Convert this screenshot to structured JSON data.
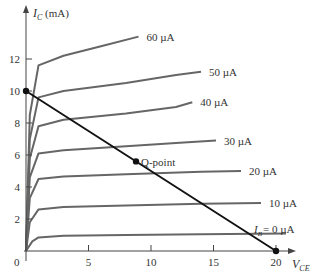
{
  "chart_data": {
    "type": "line",
    "title": "",
    "xlabel": "V_CE",
    "ylabel": "I_C (mA)",
    "xlim": [
      0,
      20
    ],
    "ylim": [
      0,
      14
    ],
    "x_ticks": [
      0,
      5,
      10,
      15,
      20
    ],
    "y_ticks": [
      2,
      4,
      6,
      8,
      10,
      12
    ],
    "series": [
      {
        "name": "I_B = 0 µA",
        "label": "= 0 µA",
        "x": [
          0,
          0.5,
          1,
          3,
          8,
          14,
          20.8
        ],
        "values": [
          0,
          0.6,
          0.85,
          0.95,
          1.0,
          1.05,
          1.1
        ]
      },
      {
        "name": "10 µA",
        "label": "10 µA",
        "x": [
          0,
          0.3,
          1,
          3,
          8,
          14,
          18.8
        ],
        "values": [
          0,
          1.8,
          2.6,
          2.75,
          2.85,
          2.95,
          3.0
        ]
      },
      {
        "name": "20 µA",
        "label": "20 µA",
        "x": [
          0,
          0.3,
          1,
          3,
          8,
          14,
          17.2
        ],
        "values": [
          0,
          3.3,
          4.5,
          4.65,
          4.8,
          4.95,
          5.0
        ]
      },
      {
        "name": "30 µA",
        "label": "30 µA",
        "x": [
          0,
          0.3,
          1,
          3,
          8,
          12,
          15.2
        ],
        "values": [
          0,
          4.6,
          6.1,
          6.3,
          6.55,
          6.75,
          6.9
        ]
      },
      {
        "name": "40 µA",
        "label": "40 µA",
        "x": [
          0,
          0.3,
          1,
          3,
          8,
          12,
          13.3
        ],
        "values": [
          0,
          5.8,
          7.8,
          8.2,
          8.6,
          9.0,
          9.3
        ]
      },
      {
        "name": "50 µA",
        "label": "50 µA",
        "x": [
          0,
          0.3,
          1,
          3,
          8,
          12,
          14.0
        ],
        "values": [
          0,
          7.0,
          9.6,
          10.0,
          10.5,
          11.0,
          11.2
        ]
      },
      {
        "name": "60 µA",
        "label": "60 µA",
        "x": [
          0,
          0.3,
          1,
          3,
          6,
          9.0
        ],
        "values": [
          0,
          8.5,
          11.6,
          12.2,
          12.8,
          13.4
        ]
      }
    ],
    "load_line": {
      "x": [
        0,
        20
      ],
      "values": [
        10,
        0
      ]
    },
    "q_point": {
      "x": 8.8,
      "y": 5.6,
      "label": "Q-point"
    },
    "annotations": [
      "I_B = 0 µA",
      "Q-point"
    ],
    "grid": false,
    "legend": "inline labels at curve ends"
  },
  "labels": {
    "y_axis_main": "I",
    "y_axis_sub": "C",
    "y_axis_unit": " (mA)",
    "x_axis_main": "V",
    "x_axis_sub": "CE",
    "ib_main": "I",
    "ib_sub": "B",
    "q_point": "Q-point",
    "origin": "0"
  },
  "colors": {
    "curve": "#666666",
    "load_line": "#111111",
    "axis": "#444444",
    "text": "#333333"
  }
}
